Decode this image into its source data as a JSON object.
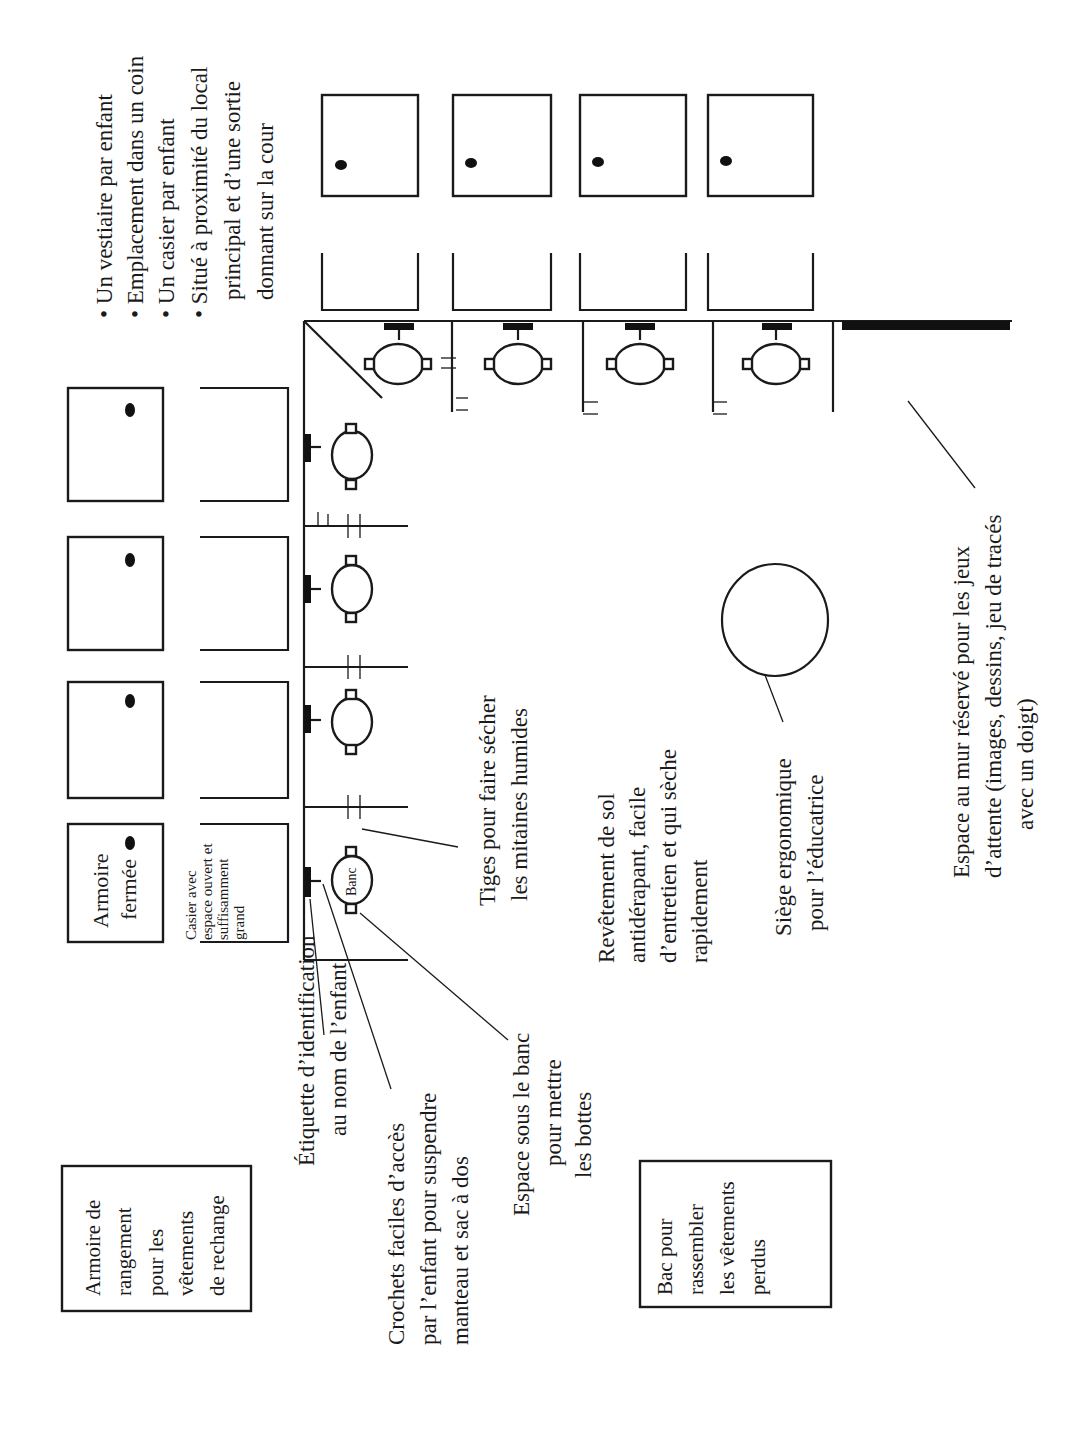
{
  "diagram": {
    "type": "floor-plan",
    "orientation": "rotated-90-counterclockwise",
    "colors": {
      "ink": "#1a1a1a",
      "paper": "#ffffff"
    },
    "features": {
      "title_lines": [
        "• Un vestiaire par enfant",
        "• Emplacement dans un coin",
        "• Un casier par enfant",
        "• Situé à proximité du local",
        "principal et d’une sortie",
        "donnant sur la cour"
      ]
    },
    "boxes": {
      "armoire_fermee": {
        "lines": [
          "Armoire",
          "fermée"
        ]
      },
      "casier": {
        "lines": [
          "Casier avec",
          "espace ouvert et",
          "suffisamment",
          "grand"
        ]
      },
      "armoire_rangement": {
        "lines": [
          "Armoire de",
          "rangement",
          "pour les",
          "vêtements",
          "de rechange"
        ]
      },
      "bac": {
        "lines": [
          "Bac pour",
          "rassembler",
          "les vêtements",
          "perdus"
        ]
      }
    },
    "bench_label": "Banc",
    "labels": {
      "etiquette": {
        "lines": [
          "Étiquette d’identification",
          "au nom de l’enfant"
        ]
      },
      "crochets": {
        "lines": [
          "Crochets faciles d’accès",
          "par l’enfant pour suspendre",
          "manteau et sac à dos"
        ]
      },
      "espace_banc": {
        "lines": [
          "Espace sous le banc",
          "pour mettre",
          "les bottes"
        ]
      },
      "tiges": {
        "lines": [
          "Tiges pour faire sécher",
          "les mitaines humides"
        ]
      },
      "revetement": {
        "lines": [
          "Revêtement de sol",
          "antidérapant, facile",
          "d’entretien et qui sèche",
          "rapidement"
        ]
      },
      "siege": {
        "lines": [
          "Siège ergonomique",
          "pour l’éducatrice"
        ]
      },
      "espace_mur": {
        "lines": [
          "Espace au mur réservé pour les jeux",
          "d’attente (images, dessins, jeu de tracés",
          "avec un doigt)"
        ]
      }
    },
    "counts": {
      "left_wall_stations": 4,
      "top_wall_stations": 4,
      "left_armoires": 4,
      "top_armoires": 4
    }
  }
}
